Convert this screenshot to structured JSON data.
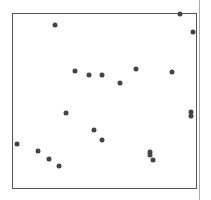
{
  "chart_data": {
    "type": "scatter",
    "title": "",
    "xlabel": "",
    "ylabel": "",
    "grid": false,
    "legend": null,
    "frame": {
      "left": 12,
      "top": 13,
      "right": 197,
      "bottom": 189
    },
    "points_px": [
      {
        "x": 55,
        "y": 25
      },
      {
        "x": 180,
        "y": 14
      },
      {
        "x": 193,
        "y": 32
      },
      {
        "x": 75,
        "y": 71
      },
      {
        "x": 89,
        "y": 75
      },
      {
        "x": 102,
        "y": 75
      },
      {
        "x": 120,
        "y": 83
      },
      {
        "x": 136,
        "y": 69
      },
      {
        "x": 172,
        "y": 72
      },
      {
        "x": 66,
        "y": 113
      },
      {
        "x": 191,
        "y": 112
      },
      {
        "x": 191,
        "y": 116
      },
      {
        "x": 94,
        "y": 130
      },
      {
        "x": 102,
        "y": 140
      },
      {
        "x": 17,
        "y": 144
      },
      {
        "x": 38,
        "y": 151
      },
      {
        "x": 49,
        "y": 159
      },
      {
        "x": 59,
        "y": 166
      },
      {
        "x": 150,
        "y": 152
      },
      {
        "x": 150,
        "y": 155
      },
      {
        "x": 153,
        "y": 160
      }
    ]
  },
  "colors": {
    "point": "#444444",
    "frame": "#555555",
    "divider": "#aaaaaa"
  }
}
